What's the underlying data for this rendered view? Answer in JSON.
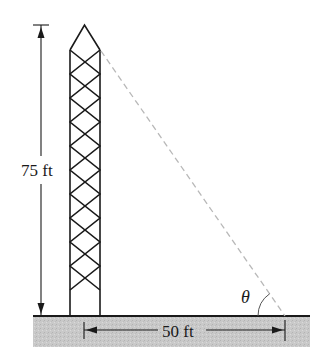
{
  "diagram": {
    "type": "geometry-figure",
    "labels": {
      "tower_height": "75 ft",
      "ground_distance": "50 ft",
      "angle": "θ"
    },
    "colors": {
      "stroke": "#1a1a1a",
      "sight_line": "#b8b8b8",
      "ground_fill": "#c9c9c9"
    },
    "elements": [
      {
        "id": "tower",
        "kind": "lattice tower",
        "height_label": "75 ft"
      },
      {
        "id": "ground",
        "kind": "shaded ground strip"
      },
      {
        "id": "sight-line",
        "kind": "dashed line from tower top to ground point"
      },
      {
        "id": "angle-arc",
        "kind": "arc marking angle θ at ground point"
      },
      {
        "id": "height-dimension",
        "kind": "vertical dimension arrow",
        "label": "75 ft"
      },
      {
        "id": "distance-dimension",
        "kind": "horizontal dimension arrow",
        "label": "50 ft"
      }
    ]
  }
}
